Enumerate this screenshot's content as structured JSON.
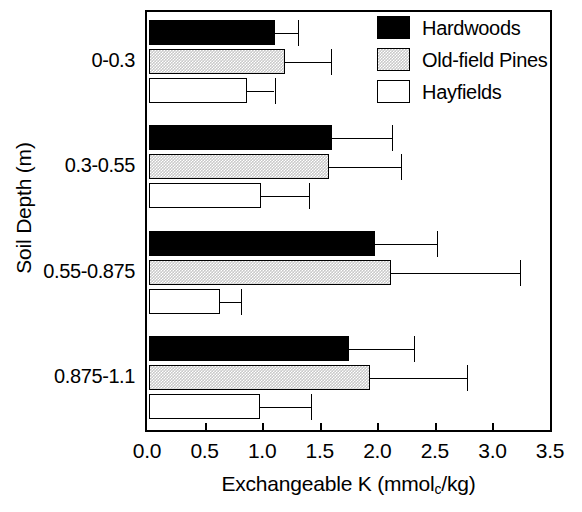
{
  "chart_data": {
    "type": "bar",
    "orientation": "horizontal",
    "title": "",
    "xlabel": "Exchangeable K (mmol_c/kg)",
    "xlabel_main": "Exchangeable K (mmol",
    "xlabel_sub": "c",
    "xlabel_tail": "/kg)",
    "ylabel": "Soil Depth (m)",
    "xlim": [
      0.0,
      3.5
    ],
    "xticks": [
      0.0,
      0.5,
      1.0,
      1.5,
      2.0,
      2.5,
      3.0,
      3.5
    ],
    "xticklabels": [
      "0.0",
      "0.5",
      "1.0",
      "1.5",
      "2.0",
      "2.5",
      "3.0",
      "3.5"
    ],
    "categories": [
      "0-0.3",
      "0.3-0.55",
      "0.55-0.875",
      "0.875-1.1"
    ],
    "grid": false,
    "legend_position": "top-right",
    "series": [
      {
        "name": "Hardwoods",
        "color": "#000000",
        "fill": "solid-black",
        "values": [
          1.09,
          1.59,
          1.96,
          1.74
        ],
        "errors": [
          0.2,
          0.52,
          0.54,
          0.56
        ]
      },
      {
        "name": "Old-field Pines",
        "color": "#c9c9c9",
        "fill": "stippled-gray",
        "values": [
          1.18,
          1.56,
          2.1,
          1.92
        ],
        "errors": [
          0.4,
          0.63,
          1.12,
          0.84
        ]
      },
      {
        "name": "Hayfields",
        "color": "#ffffff",
        "fill": "white",
        "values": [
          0.85,
          0.97,
          0.62,
          0.96
        ],
        "errors": [
          0.24,
          0.42,
          0.18,
          0.45
        ]
      }
    ]
  },
  "legend": {
    "items": [
      {
        "label": "Hardwoods",
        "swatch": "hardwoods"
      },
      {
        "label": "Old-field Pines",
        "swatch": "pines"
      },
      {
        "label": "Hayfields",
        "swatch": "hayfields"
      }
    ]
  },
  "axes": {
    "y_title": "Soil Depth (m)",
    "y_categories": [
      "0-0.3",
      "0.3-0.55",
      "0.55-0.875",
      "0.875-1.1"
    ],
    "x_tick_labels": [
      "0.0",
      "0.5",
      "1.0",
      "1.5",
      "2.0",
      "2.5",
      "3.0",
      "3.5"
    ]
  }
}
